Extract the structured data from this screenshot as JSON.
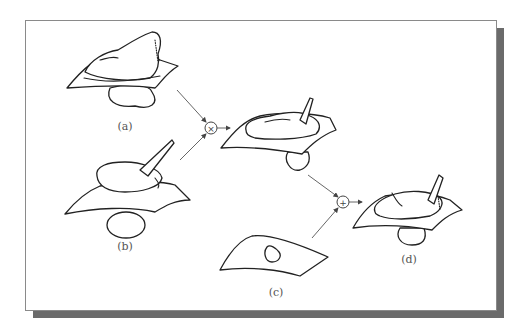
{
  "figure": {
    "panels": [
      {
        "id": "a",
        "label": "(a)",
        "description": "object shape penetrating a curved surface sheet"
      },
      {
        "id": "b",
        "label": "(b)",
        "description": "smooth blob with horn penetrating a curved sheet"
      },
      {
        "id": "c",
        "label": "(c)",
        "description": "curved sheet with small hole"
      },
      {
        "id": "d",
        "label": "(d)",
        "description": "final combined shape with sheet"
      }
    ],
    "operators": [
      {
        "id": "multiply",
        "symbol": "×",
        "inputs": [
          "a",
          "b"
        ],
        "output": "intermediate"
      },
      {
        "id": "add",
        "symbol": "+",
        "inputs": [
          "intermediate",
          "c"
        ],
        "output": "d"
      }
    ],
    "colors": {
      "frame_border": "#8a8a8a",
      "shadow": "#6b6b6b",
      "line": "#222222",
      "arrow": "#555555",
      "label": "#555555"
    }
  }
}
